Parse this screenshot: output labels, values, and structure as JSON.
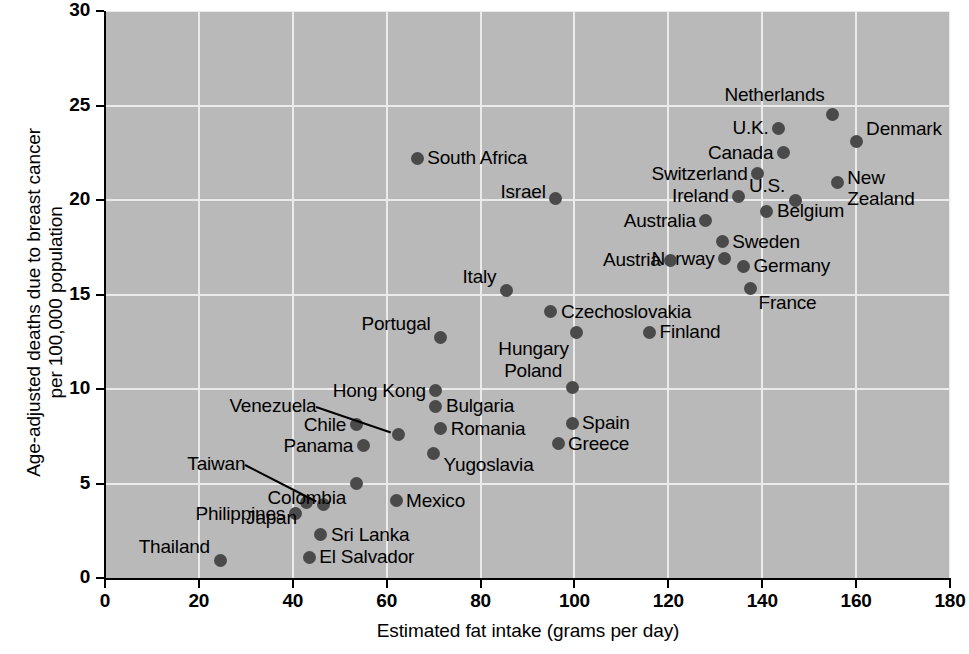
{
  "chart": {
    "type": "scatter",
    "title": "",
    "xlabel": "Estimated fat intake (grams per day)",
    "ylabel_line1": "Age-adjusted deaths due to breast cancer",
    "ylabel_line2": "per 100,000 population"
  },
  "axes": {
    "x_ticks": [
      "0",
      "20",
      "40",
      "60",
      "80",
      "100",
      "120",
      "140",
      "160",
      "180"
    ],
    "y_ticks": [
      "0",
      "5",
      "10",
      "15",
      "20",
      "25",
      "30"
    ],
    "xlim": [
      0,
      180
    ],
    "ylim": [
      0,
      30
    ],
    "grid": "on",
    "plot_bg": "#b9b9b9",
    "grid_color": "#ebebeb",
    "dot_color": "#4a4a4a"
  },
  "chart_data": {
    "type": "scatter",
    "title": "",
    "xlabel": "Estimated fat intake (grams per day)",
    "ylabel": "Age-adjusted deaths due to breast cancer per 100,000 population",
    "xlim": [
      0,
      180
    ],
    "ylim": [
      0,
      30
    ],
    "grid": true,
    "legend": "none",
    "points": [
      {
        "name": "Thailand",
        "x": 24.5,
        "y": 0.9,
        "label_side": "left",
        "dx": -10,
        "dy": -14
      },
      {
        "name": "El Salvador",
        "x": 43.5,
        "y": 1.1,
        "label_side": "right",
        "dx": 10,
        "dy": 0
      },
      {
        "name": "Sri Lanka",
        "x": 46.0,
        "y": 2.3,
        "label_side": "right",
        "dx": 10,
        "dy": 0
      },
      {
        "name": "Philippines",
        "x": 40.5,
        "y": 3.4,
        "label_side": "left",
        "dx": -10,
        "dy": 0
      },
      {
        "name": "Japan",
        "x": 43.0,
        "y": 4.0,
        "label_side": "left",
        "dx": -10,
        "dy": 16
      },
      {
        "name": "Taiwan",
        "x": 46.5,
        "y": 3.9,
        "label_side": "left",
        "dx": -78,
        "dy": -40,
        "leader": true
      },
      {
        "name": "Mexico",
        "x": 62.0,
        "y": 4.1,
        "label_side": "right",
        "dx": 10,
        "dy": 0
      },
      {
        "name": "Colombia",
        "x": 53.5,
        "y": 5.0,
        "label_side": "left",
        "dx": -10,
        "dy": 14
      },
      {
        "name": "Panama",
        "x": 55.0,
        "y": 7.0,
        "label_side": "left",
        "dx": -10,
        "dy": 0
      },
      {
        "name": "Chile",
        "x": 53.5,
        "y": 8.1,
        "label_side": "left",
        "dx": -10,
        "dy": 0
      },
      {
        "name": "Venezuela",
        "x": 62.5,
        "y": 7.6,
        "label_side": "left",
        "dx": -82,
        "dy": -28,
        "leader": true
      },
      {
        "name": "Yugoslavia",
        "x": 70.0,
        "y": 6.6,
        "label_side": "right",
        "dx": 10,
        "dy": 12
      },
      {
        "name": "Romania",
        "x": 71.5,
        "y": 7.9,
        "label_side": "right",
        "dx": 10,
        "dy": 0
      },
      {
        "name": "Bulgaria",
        "x": 70.5,
        "y": 9.1,
        "label_side": "right",
        "dx": 10,
        "dy": 0
      },
      {
        "name": "Greece",
        "x": 96.5,
        "y": 7.1,
        "label_side": "right",
        "dx": 10,
        "dy": 0
      },
      {
        "name": "Spain",
        "x": 99.5,
        "y": 8.2,
        "label_side": "right",
        "dx": 10,
        "dy": 0
      },
      {
        "name": "Hong Kong",
        "x": 70.5,
        "y": 9.9,
        "label_side": "left",
        "dx": -10,
        "dy": 0
      },
      {
        "name": "Poland",
        "x": 99.5,
        "y": 10.1,
        "label_side": "left",
        "dx": -10,
        "dy": -16
      },
      {
        "name": "Portugal",
        "x": 71.5,
        "y": 12.7,
        "label_side": "left",
        "dx": -10,
        "dy": -14
      },
      {
        "name": "Hungary",
        "x": 100.5,
        "y": 13.0,
        "label_side": "left",
        "dx": -8,
        "dy": 17
      },
      {
        "name": "Finland",
        "x": 116.0,
        "y": 13.0,
        "label_side": "right",
        "dx": 10,
        "dy": 0
      },
      {
        "name": "Czechoslovakia",
        "x": 95.0,
        "y": 14.1,
        "label_side": "right",
        "dx": 10,
        "dy": 0
      },
      {
        "name": "Italy",
        "x": 85.5,
        "y": 15.2,
        "label_side": "left",
        "dx": -10,
        "dy": -14
      },
      {
        "name": "France",
        "x": 137.5,
        "y": 15.3,
        "label_side": "right",
        "dx": 8,
        "dy": 14
      },
      {
        "name": "Germany",
        "x": 136.0,
        "y": 16.5,
        "label_side": "right",
        "dx": 10,
        "dy": 0
      },
      {
        "name": "Norway",
        "x": 132.0,
        "y": 16.9,
        "label_side": "left",
        "dx": -10,
        "dy": 0
      },
      {
        "name": "Austria",
        "x": 120.5,
        "y": 16.8,
        "label_side": "left",
        "dx": -10,
        "dy": 0
      },
      {
        "name": "Sweden",
        "x": 131.5,
        "y": 17.8,
        "label_side": "right",
        "dx": 10,
        "dy": 0
      },
      {
        "name": "Australia",
        "x": 128.0,
        "y": 18.9,
        "label_side": "left",
        "dx": -10,
        "dy": 0
      },
      {
        "name": "Belgium",
        "x": 141.0,
        "y": 19.4,
        "label_side": "right",
        "dx": 10,
        "dy": 0
      },
      {
        "name": "Ireland",
        "x": 135.0,
        "y": 20.2,
        "label_side": "left",
        "dx": -10,
        "dy": 0
      },
      {
        "name": "U.S.",
        "x": 147.0,
        "y": 20.0,
        "label_side": "left",
        "dx": -10,
        "dy": -14
      },
      {
        "name": "Switzerland",
        "x": 139.0,
        "y": 21.4,
        "label_side": "left",
        "dx": -10,
        "dy": 0
      },
      {
        "name": "New Zealand",
        "x": 156.0,
        "y": 20.9,
        "label_side": "right",
        "dx": 10,
        "dy": 6
      },
      {
        "name": "South Africa",
        "x": 66.5,
        "y": 22.2,
        "label_side": "right",
        "dx": 10,
        "dy": 0
      },
      {
        "name": "Canada",
        "x": 144.5,
        "y": 22.5,
        "label_side": "left",
        "dx": -10,
        "dy": 0
      },
      {
        "name": "Denmark",
        "x": 160.0,
        "y": 23.1,
        "label_side": "right",
        "dx": 10,
        "dy": -12
      },
      {
        "name": "U.K.",
        "x": 143.5,
        "y": 23.8,
        "label_side": "left",
        "dx": -10,
        "dy": 0
      },
      {
        "name": "Netherlands",
        "x": 155.0,
        "y": 24.5,
        "label_side": "left",
        "dx": -8,
        "dy": -20
      },
      {
        "name": "Israel",
        "x": 96.0,
        "y": 20.1,
        "label_side": "left",
        "dx": -10,
        "dy": -6
      }
    ]
  }
}
